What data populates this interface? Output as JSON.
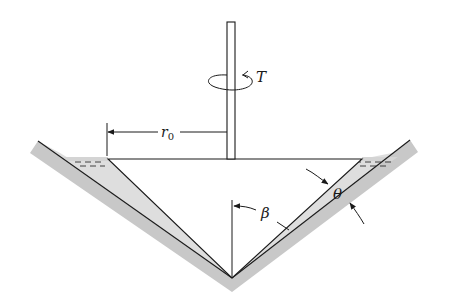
{
  "figure": {
    "labels": {
      "torque": "T",
      "radius": "r",
      "radius_subscript": "0",
      "cone_angle": "β",
      "gap_angle": "θ"
    },
    "colors": {
      "line": "#1a1a1a",
      "wall_fill": "#c8c8c8",
      "fluid_fill": "#dcdcdc",
      "background": "#ffffff"
    }
  }
}
